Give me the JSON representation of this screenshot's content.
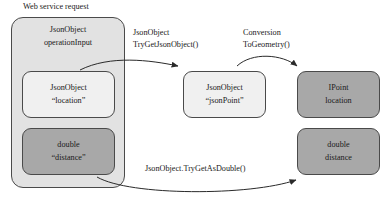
{
  "diagram": {
    "title": "Web service request",
    "type": "flow-diagram",
    "colors": {
      "container_fill": "#e2e2e2",
      "light_box_fill": "#f0f0f0",
      "dark_box_fill": "#a8a8a8",
      "stroke": "#4a4a4a",
      "text": "#1a1a1a",
      "background": "#ffffff"
    },
    "nodes": {
      "operation_input": {
        "line1": "JsonObject",
        "line2": "operationInput",
        "style": "container"
      },
      "location_json": {
        "line1": "JsonObject",
        "line2": "“location”",
        "style": "light"
      },
      "distance_json": {
        "line1": "double",
        "line2": "“distance”",
        "style": "dark"
      },
      "json_point": {
        "line1": "JsonObject",
        "line2": "“jsonPoint”",
        "style": "light"
      },
      "ipoint_location": {
        "line1": "IPoint",
        "line2": "location",
        "style": "dark"
      },
      "double_distance": {
        "line1": "double",
        "line2": "distance",
        "style": "dark"
      }
    },
    "edges": {
      "try_get_json_object": {
        "line1": "JsonObject",
        "line2": "TryGetJsonObject()",
        "from": "location_json",
        "to": "json_point"
      },
      "conversion_to_geometry": {
        "line1": "Conversion",
        "line2": "ToGeometry()",
        "from": "json_point",
        "to": "ipoint_location"
      },
      "try_get_as_double": {
        "line1": "JsonObject.TryGetAsDouble()",
        "line2": "",
        "from": "distance_json",
        "to": "double_distance"
      }
    }
  }
}
